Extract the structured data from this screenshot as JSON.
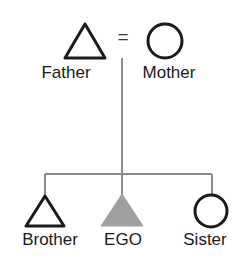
{
  "diagram": {
    "type": "kinship-genealogy",
    "background_color": "#ffffff",
    "symbol_outline_color": "#1a1a1a",
    "connector_color": "#8c8c8c",
    "ego_fill_color": "#a0a0a0",
    "union_symbol": "=",
    "generations": [
      {
        "name": "parents",
        "members": [
          {
            "id": "father",
            "label": "Father",
            "shape": "triangle",
            "sex": "male",
            "filled": false
          },
          {
            "id": "mother",
            "label": "Mother",
            "shape": "circle",
            "sex": "female",
            "filled": false
          }
        ]
      },
      {
        "name": "children",
        "members": [
          {
            "id": "brother",
            "label": "Brother",
            "shape": "triangle",
            "sex": "male",
            "filled": false
          },
          {
            "id": "ego",
            "label": "EGO",
            "shape": "triangle",
            "sex": "male",
            "filled": true
          },
          {
            "id": "sister",
            "label": "Sister",
            "shape": "circle",
            "sex": "female",
            "filled": false
          }
        ]
      }
    ],
    "relations": [
      {
        "type": "marriage",
        "from": "father",
        "to": "mother",
        "marker": "="
      },
      {
        "type": "descent",
        "from": "marriage",
        "to": "brother"
      },
      {
        "type": "descent",
        "from": "marriage",
        "to": "ego"
      },
      {
        "type": "descent",
        "from": "marriage",
        "to": "sister"
      }
    ]
  }
}
